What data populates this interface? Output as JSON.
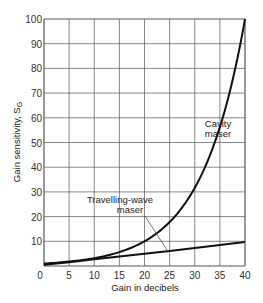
{
  "chart_data": {
    "type": "line",
    "title": "",
    "xlabel": "Gain in decibels",
    "ylabel": "Gain sensitivity, S",
    "ylabel_subscript": "G",
    "xlim": [
      0,
      40
    ],
    "ylim": [
      0,
      100
    ],
    "x_ticks": [
      0,
      5,
      10,
      15,
      20,
      25,
      30,
      35,
      40
    ],
    "y_ticks": [
      10,
      20,
      30,
      40,
      50,
      60,
      70,
      80,
      90,
      100
    ],
    "origin_label": "0",
    "grid": true,
    "legend": "none (inline annotations)",
    "series": [
      {
        "name": "Cavity maser",
        "x": [
          0,
          5,
          10,
          15,
          20,
          25,
          30,
          32,
          34,
          36,
          38,
          40
        ],
        "y": [
          1,
          1.8,
          3.2,
          5.6,
          10,
          17.8,
          31.6,
          39.8,
          50.1,
          63.1,
          79.4,
          100
        ]
      },
      {
        "name": "Travelling-wave maser",
        "x": [
          0,
          5,
          10,
          15,
          20,
          25,
          30,
          35,
          40
        ],
        "y": [
          0.5,
          1.5,
          2.7,
          3.8,
          5.0,
          6.1,
          7.3,
          8.5,
          9.7
        ]
      }
    ],
    "annotations": [
      {
        "text_lines": [
          "Cavity",
          "maser"
        ],
        "near_x": 32,
        "near_y": 62
      },
      {
        "text_lines": [
          "Travelling-wave",
          "maser"
        ],
        "near_x": 15,
        "near_y": 25,
        "leader_to": [
          24.5,
          6
        ]
      }
    ]
  },
  "colors": {
    "line": "#111111",
    "grid": "#555555",
    "text": "#333333"
  }
}
